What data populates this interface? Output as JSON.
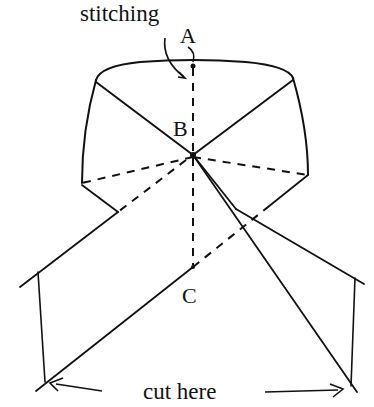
{
  "diagram": {
    "labels": {
      "stitching": "stitching",
      "point_a": "A",
      "point_b": "B",
      "point_c": "C",
      "cut_here": "cut here"
    },
    "stroke_color": "#111111",
    "background": "#ffffff"
  }
}
